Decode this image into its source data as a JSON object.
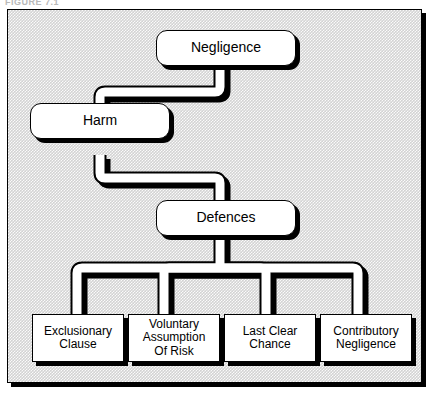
{
  "figure": {
    "caption": "FIGURE 7.1"
  },
  "diagram": {
    "type": "flowchart",
    "background_color": "#d3d3d3",
    "node_fill_color": "#ffffff",
    "line_color": "#000000",
    "shadow_color": "#000000",
    "nodes": [
      {
        "id": "negligence",
        "label": "Negligence",
        "shape": "rounded-rect",
        "level": 1
      },
      {
        "id": "harm",
        "label": "Harm",
        "shape": "rounded-rect",
        "level": 2
      },
      {
        "id": "defences",
        "label": "Defences",
        "shape": "rounded-rect",
        "level": 3
      },
      {
        "id": "exclusionary",
        "label": "Exclusionary\nClause",
        "shape": "rect",
        "level": 4
      },
      {
        "id": "voluntary",
        "label": "Voluntary\nAssumption\nOf Risk",
        "shape": "rect",
        "level": 4
      },
      {
        "id": "lastclear",
        "label": "Last Clear\nChance",
        "shape": "rect",
        "level": 4
      },
      {
        "id": "contributory",
        "label": "Contributory\nNegligence",
        "shape": "rect",
        "level": 4
      }
    ],
    "edges": [
      {
        "from": "negligence",
        "to": "harm",
        "style": "elbow"
      },
      {
        "from": "harm",
        "to": "defences",
        "style": "elbow"
      },
      {
        "from": "defences",
        "to": "exclusionary",
        "style": "branch"
      },
      {
        "from": "defences",
        "to": "voluntary",
        "style": "branch"
      },
      {
        "from": "defences",
        "to": "lastclear",
        "style": "branch"
      },
      {
        "from": "defences",
        "to": "contributory",
        "style": "branch"
      }
    ]
  }
}
